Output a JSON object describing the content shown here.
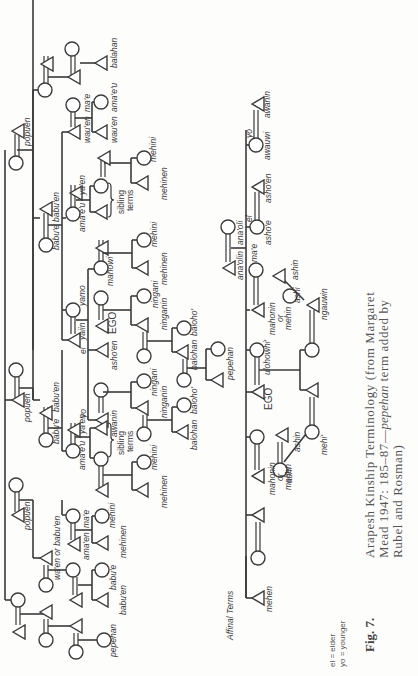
{
  "figure": {
    "number": "Fig. 7.",
    "caption_line1": "Arapesh Kinship Terminology (from Margaret",
    "caption_line2_prefix": "Mead 1947: 185–87—",
    "caption_line2_italic": "pepehan",
    "caption_line2_suffix": " term added by",
    "caption_line3": "Rubel and Rosman)",
    "legend_el": "el = elder",
    "legend_yo": "yo = younger",
    "affinal_heading": "Affinal Terms"
  },
  "labels": {
    "ego": "EGO",
    "popuen": "popuen",
    "babu_e": "babu'e",
    "babu_en": "babu'en",
    "ama_e_u": "ama'e'u",
    "ya_en": "ya'en",
    "wau_en": "wau'en",
    "ma_e": "ma'e",
    "balahan": "balahan",
    "mehini": "mehini",
    "mehinen": "mehinen",
    "sibling_terms_1": "sibling",
    "sibling_terms_2": "terms",
    "mahowi": "mahowi",
    "yamo": "yamo",
    "yaiin": "yaiin",
    "el": "el",
    "yo": "yo",
    "asho_en": "asho'en",
    "awanin": "awanin",
    "ningani": "ningani",
    "ninganin": "ninganin",
    "balohan": "balohan",
    "baloho": "baloho'",
    "pepehan": "pepehan",
    "wa_en_or_babu_en": "wa'en or babu'en",
    "ama_en": "ama'en",
    "ana_olin": "ana'olin",
    "ana_oli": "ana'oli",
    "asho_e": "asho'e",
    "awauwi": "awauwi",
    "mahonin": "mahonin",
    "or": "or",
    "mehin": "mehin",
    "ulohowhi": "ulohowhi'",
    "ashi": "ashi",
    "ashin": "ashin",
    "ngauwin": "ngauwin",
    "mehi": "mehi'",
    "mehen": "mehen"
  }
}
